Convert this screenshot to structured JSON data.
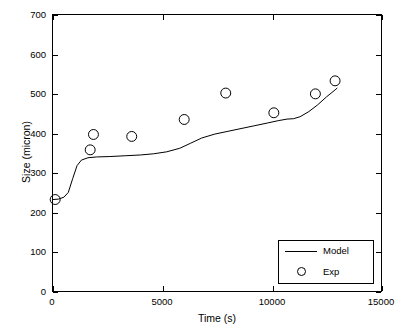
{
  "chart_data": {
    "type": "line",
    "title": "",
    "xlabel": "Time (s)",
    "ylabel": "Size (micron)",
    "xlim": [
      0,
      15000
    ],
    "ylim": [
      0,
      700
    ],
    "xticks": [
      0,
      5000,
      10000,
      15000
    ],
    "xticklabels": [
      "0",
      "5000",
      "10000",
      "15000"
    ],
    "yticks": [
      0,
      100,
      200,
      300,
      400,
      500,
      600,
      700
    ],
    "yticklabels": [
      "0",
      "100",
      "200",
      "300",
      "400",
      "500",
      "600",
      "700"
    ],
    "grid": false,
    "legend": {
      "position": "lower-right",
      "entries": [
        {
          "label": "Model",
          "marker": "line"
        },
        {
          "label": "Exp",
          "marker": "circle"
        }
      ]
    },
    "series": [
      {
        "name": "Model",
        "type": "line",
        "color": "#000000",
        "points": [
          [
            0,
            232
          ],
          [
            250,
            233
          ],
          [
            500,
            238
          ],
          [
            700,
            250
          ],
          [
            900,
            285
          ],
          [
            1100,
            318
          ],
          [
            1300,
            332
          ],
          [
            1600,
            338
          ],
          [
            2000,
            340
          ],
          [
            2600,
            341
          ],
          [
            3300,
            343
          ],
          [
            4000,
            345
          ],
          [
            4600,
            348
          ],
          [
            5200,
            353
          ],
          [
            5800,
            362
          ],
          [
            6300,
            375
          ],
          [
            6800,
            388
          ],
          [
            7400,
            398
          ],
          [
            8000,
            405
          ],
          [
            8600,
            412
          ],
          [
            9200,
            419
          ],
          [
            9800,
            426
          ],
          [
            10300,
            432
          ],
          [
            10700,
            436
          ],
          [
            11000,
            437
          ],
          [
            11300,
            442
          ],
          [
            11700,
            455
          ],
          [
            12100,
            472
          ],
          [
            12500,
            492
          ],
          [
            12900,
            510
          ],
          [
            13000,
            515
          ]
        ]
      },
      {
        "name": "Exp",
        "type": "scatter",
        "marker": "circle",
        "color": "#000000",
        "points": [
          [
            100,
            232
          ],
          [
            1700,
            358
          ],
          [
            1850,
            397
          ],
          [
            3600,
            392
          ],
          [
            6000,
            435
          ],
          [
            7900,
            502
          ],
          [
            10100,
            452
          ],
          [
            12000,
            500
          ],
          [
            12900,
            533
          ]
        ]
      }
    ]
  }
}
